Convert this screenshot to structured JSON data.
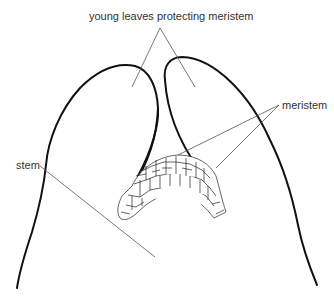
{
  "diagram": {
    "labels": {
      "young_leaves": "young leaves protecting meristem",
      "meristem": "meristem",
      "stem": "stem"
    },
    "colors": {
      "outline": "#111111",
      "leader": "#555555",
      "text": "#333333",
      "background": "#ffffff"
    }
  }
}
